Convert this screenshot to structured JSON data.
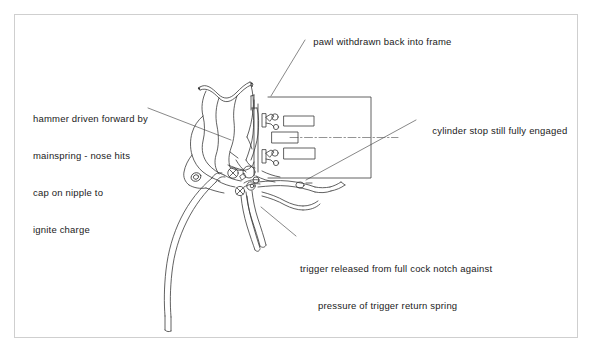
{
  "diagram": {
    "frame_border_color": "#cfcfcf",
    "line_color": "#333333",
    "background_color": "#ffffff"
  },
  "annotations": {
    "pawl": {
      "text": "pawl withdrawn back into frame",
      "line1": "pawl withdrawn back into frame"
    },
    "hammer": {
      "line1": "hammer driven forward by",
      "line2": "mainspring - nose hits",
      "line3": "cap on nipple to",
      "line4": "ignite charge"
    },
    "cylinder_stop": {
      "line1": "cylinder stop still fully engaged"
    },
    "trigger": {
      "line1": "trigger released from full cock notch against",
      "line2": "pressure of trigger return spring"
    }
  },
  "parts": {
    "hammer": "hammer",
    "hammer_nose": "hammer-nose",
    "mainspring": "mainspring",
    "trigger": "trigger",
    "trigger_return_spring": "trigger-return-spring",
    "pawl": "pawl",
    "cylinder_stop": "cylinder-stop",
    "cylinder": "cylinder",
    "nipple_upper": "nipple-upper",
    "nipple_lower": "nipple-lower",
    "chamber_upper": "chamber-upper",
    "chamber_middle": "chamber-middle",
    "chamber_lower": "chamber-lower",
    "centerline": "bore-centerline",
    "frame": "revolver-frame",
    "screw_upper": "frame-screw-upper",
    "screw_lower": "frame-screw-lower",
    "pivot_hammer": "hammer-pivot",
    "pivot_trigger": "trigger-pivot"
  }
}
